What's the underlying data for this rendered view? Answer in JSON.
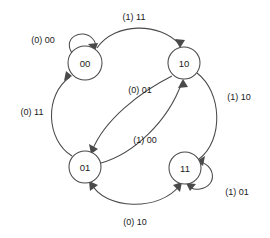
{
  "diagram": {
    "type": "finite-state-machine",
    "title": "",
    "stroke_color": "#4a4a4a",
    "text_color": "#1a1a1a",
    "background_color": "#ffffff",
    "states": [
      {
        "id": "s00",
        "label": "00",
        "cx": 85,
        "cy": 63,
        "r": 17
      },
      {
        "id": "s10",
        "label": "10",
        "cx": 184,
        "cy": 63,
        "r": 16
      },
      {
        "id": "s01",
        "label": "01",
        "cx": 85,
        "cy": 167,
        "r": 16
      },
      {
        "id": "s11",
        "label": "11",
        "cx": 185,
        "cy": 168,
        "r": 16
      }
    ],
    "transitions": [
      {
        "id": "t1",
        "from": "s00",
        "to": "s00",
        "label": "(1) 11",
        "label_x": 134,
        "label_y": 17,
        "kind": "arc-top"
      },
      {
        "id": "t2",
        "from": "s00",
        "to": "s00",
        "label": "(0) 00",
        "label_x": 43,
        "label_y": 40,
        "kind": "self-loop"
      },
      {
        "id": "t3",
        "from": "s01",
        "to": "s00",
        "label": "(0) 11",
        "label_x": 32,
        "label_y": 112,
        "kind": "arc-left"
      },
      {
        "id": "t4",
        "from": "s10",
        "to": "s01",
        "label": "(0) 01",
        "label_x": 140,
        "label_y": 90,
        "kind": "arc-cross"
      },
      {
        "id": "t5",
        "from": "s01",
        "to": "s10",
        "label": "(1) 00",
        "label_x": 145,
        "label_y": 140,
        "kind": "arc-cross"
      },
      {
        "id": "t6",
        "from": "s10",
        "to": "s11",
        "label": "(1) 10",
        "label_x": 239,
        "label_y": 97,
        "kind": "arc-right"
      },
      {
        "id": "t7",
        "from": "s11",
        "to": "s11",
        "label": "(1) 01",
        "label_x": 237,
        "label_y": 192,
        "kind": "self-loop"
      },
      {
        "id": "t8",
        "from": "s01",
        "to": "s11",
        "label": "(0) 10",
        "label_x": 135,
        "label_y": 222,
        "kind": "arc-bottom-bidirectional"
      }
    ],
    "labels": {
      "top": "(1) 11",
      "self_loop_00": "(0) 00",
      "left": "(0) 11",
      "cross_upper": "(0) 01",
      "cross_lower": "(1) 00",
      "right": "(1) 10",
      "self_loop_11": "(1) 01",
      "bottom": "(0) 10"
    }
  }
}
